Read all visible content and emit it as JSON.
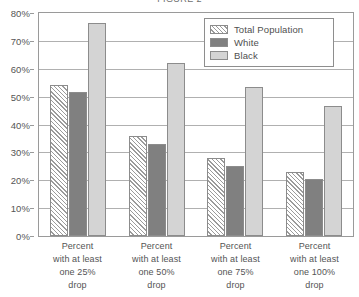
{
  "chart_data": {
    "type": "bar",
    "title": "FIGURE 2",
    "xlabel": "",
    "ylabel": "",
    "ylim": [
      0,
      80
    ],
    "ytick_values": [
      0,
      10,
      20,
      30,
      40,
      50,
      60,
      70,
      80
    ],
    "ytick_labels": [
      "0%",
      "10%",
      "20%",
      "30%",
      "40%",
      "50%",
      "60%",
      "70%",
      "80%"
    ],
    "grid": true,
    "legend_position": "top-right",
    "categories": [
      "Percent with at least one 25% drop",
      "Percent with at least one 50% drop",
      "Percent with at least one 75% drop",
      "Percent with at least one 100% drop"
    ],
    "category_lines": [
      [
        "Percent",
        "with at least",
        "one 25%",
        "drop"
      ],
      [
        "Percent",
        "with at least",
        "one 50%",
        "drop"
      ],
      [
        "Percent",
        "with at least",
        "one 75%",
        "drop"
      ],
      [
        "Percent",
        "with at least",
        "one 100%",
        "drop"
      ]
    ],
    "series": [
      {
        "name": "Total Population",
        "key": "total",
        "fill": "hatched-diagonal",
        "color": "#ffffff",
        "values": [
          54,
          36,
          28,
          23
        ]
      },
      {
        "name": "White",
        "key": "white",
        "fill": "solid",
        "color": "#808080",
        "values": [
          51.5,
          33,
          25,
          20.5
        ]
      },
      {
        "name": "Black",
        "key": "black",
        "fill": "solid",
        "color": "#d4d4d4",
        "values": [
          76.5,
          62,
          53.5,
          46.5
        ]
      }
    ]
  },
  "legend": {
    "items": [
      {
        "label": "Total Population",
        "key": "total"
      },
      {
        "label": "White",
        "key": "white"
      },
      {
        "label": "Black",
        "key": "black"
      }
    ]
  },
  "colors": {
    "axis": "#9a9a9a",
    "grid": "#b0b0b0",
    "bar_border": "#8c8c8c",
    "text": "#4f4f4f",
    "white_series": "#808080",
    "black_series": "#d4d4d4"
  }
}
